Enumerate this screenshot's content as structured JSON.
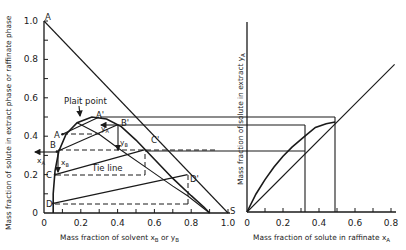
{
  "left_plot": {
    "ylabel": "Mass fraction of solute in extract phase or raffinate phase",
    "xlabel": "Mass fraction of solvent x",
    "xlabel_sub1": "B",
    "xlabel_mid": " or y",
    "xlabel_sub2": "B",
    "x_ticks": [
      "0",
      "0.2",
      "0.4",
      "0.6",
      "0.8",
      "1.0"
    ],
    "y_ticks": [
      "0",
      "0.2",
      "0.4",
      "0.6",
      "0.8",
      "1.0"
    ],
    "annotations": {
      "apex_A": "A",
      "plait_point": "Plait point",
      "A_prime": "A'",
      "B_prime": "B'",
      "C_prime": "C'",
      "D_prime": "D'",
      "A": "A",
      "B": "B",
      "C": "C",
      "D": "D",
      "S": "S",
      "tie_line": "Tie line",
      "xA": "x",
      "xA_sub": "A",
      "xB": "x",
      "xB_sub": "B",
      "yA": "y",
      "yA_sub": "A",
      "yB": "y",
      "yB_sub": "B"
    }
  },
  "right_plot": {
    "ylabel": "Mass fraction of solute in extract y",
    "ylabel_sub": "A",
    "xlabel": "Mass fraction of solute in raffinate x",
    "xlabel_sub": "A",
    "x_ticks": [
      "0",
      "0.2",
      "0.4",
      "0.6",
      "0.8"
    ]
  },
  "chart_data": [
    {
      "type": "line",
      "title": "Ternary liquid-liquid equilibrium (right-triangle diagram)",
      "xlabel": "Mass fraction of solvent xB or yB",
      "ylabel": "Mass fraction of solute in extract phase or raffinate phase",
      "xlim": [
        0,
        1.0
      ],
      "ylim": [
        0,
        1.0
      ],
      "series": [
        {
          "name": "hypotenuse A-S",
          "x": [
            0,
            1.0
          ],
          "y": [
            1.0,
            0
          ]
        },
        {
          "name": "solubility curve",
          "x": [
            0.05,
            0.05,
            0.06,
            0.08,
            0.12,
            0.18,
            0.26,
            0.34,
            0.42,
            0.5,
            0.6,
            0.7,
            0.8,
            0.87,
            0.9
          ],
          "y": [
            0.0,
            0.1,
            0.22,
            0.32,
            0.41,
            0.47,
            0.5,
            0.49,
            0.45,
            0.38,
            0.28,
            0.18,
            0.09,
            0.03,
            0.0
          ]
        },
        {
          "name": "conjugate line",
          "x": [
            0.18,
            0.3,
            0.4,
            0.55,
            0.7,
            0.78,
            0.9
          ],
          "y": [
            0.47,
            0.41,
            0.34,
            0.24,
            0.14,
            0.09,
            0.0
          ]
        },
        {
          "name": "tie line A-A'",
          "x": [
            0.1,
            0.3
          ],
          "y": [
            0.41,
            0.5
          ]
        },
        {
          "name": "tie line B-B'",
          "x": [
            0.07,
            0.4
          ],
          "y": [
            0.32,
            0.46
          ]
        },
        {
          "name": "tie line C-C'",
          "x": [
            0.06,
            0.55
          ],
          "y": [
            0.2,
            0.33
          ]
        },
        {
          "name": "tie line D-D'",
          "x": [
            0.05,
            0.78
          ],
          "y": [
            0.05,
            0.2
          ]
        }
      ],
      "points": {
        "A": [
          0.1,
          0.41
        ],
        "B": [
          0.07,
          0.32
        ],
        "C": [
          0.06,
          0.2
        ],
        "D": [
          0.05,
          0.05
        ],
        "A'": [
          0.3,
          0.5
        ],
        "B'": [
          0.4,
          0.46
        ],
        "C'": [
          0.55,
          0.33
        ],
        "D'": [
          0.78,
          0.2
        ],
        "S": [
          1.0,
          0
        ],
        "Plait point": [
          0.22,
          0.5
        ]
      }
    },
    {
      "type": "line",
      "title": "Equilibrium distribution curve",
      "xlabel": "Mass fraction of solute in raffinate xA",
      "ylabel": "Mass fraction of solute in extract yA",
      "xlim": [
        0,
        0.85
      ],
      "ylim": [
        0,
        1.05
      ],
      "series": [
        {
          "name": "45-degree line",
          "x": [
            0,
            0.82
          ],
          "y": [
            0,
            0.82
          ]
        },
        {
          "name": "equilibrium curve",
          "x": [
            0,
            0.05,
            0.1,
            0.15,
            0.2,
            0.25,
            0.32,
            0.38,
            0.44,
            0.49
          ],
          "y": [
            0,
            0.1,
            0.18,
            0.25,
            0.31,
            0.36,
            0.42,
            0.47,
            0.49,
            0.5
          ]
        }
      ],
      "construction_lines": {
        "x": [
          0.32,
          0.49
        ],
        "y": [
          0.32,
          0.46,
          0.5
        ]
      }
    }
  ]
}
